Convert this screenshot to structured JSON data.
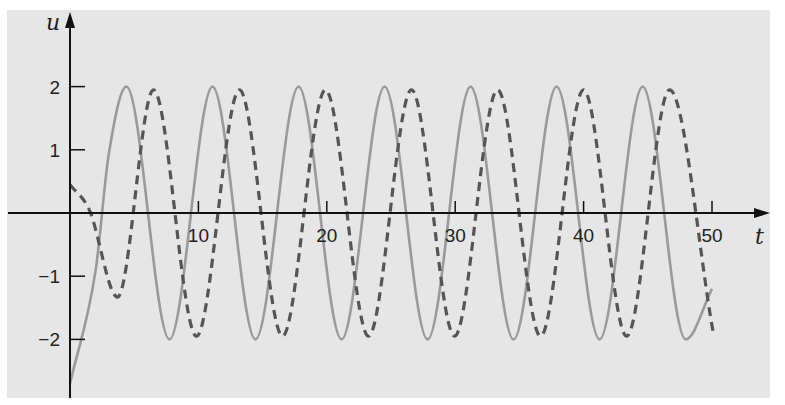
{
  "chart_data": {
    "type": "line",
    "title": "",
    "xlabel": "t",
    "ylabel": "u",
    "xlim": [
      0,
      50
    ],
    "ylim": [
      -2.8,
      3.2
    ],
    "x_ticks": [
      10,
      20,
      30,
      40,
      50
    ],
    "x_tick_labels": [
      "10",
      "20",
      "30",
      "40",
      "50"
    ],
    "y_ticks": [
      2,
      1,
      -1,
      -2
    ],
    "y_tick_labels": [
      "2",
      "1",
      "−1",
      "−2"
    ],
    "grid": false,
    "legend": null,
    "series": [
      {
        "name": "u (solid)",
        "style": "solid",
        "color": "#9a9a9a",
        "key_points": [
          {
            "t": 0.0,
            "u": -2.7
          },
          {
            "t": 2.0,
            "u": -0.9
          },
          {
            "t": 3.0,
            "u": 0.9
          },
          {
            "t": 4.4,
            "u": 2.0
          },
          {
            "t": 7.75,
            "u": -2.0
          },
          {
            "t": 11.1,
            "u": 2.0
          },
          {
            "t": 14.45,
            "u": -2.0
          },
          {
            "t": 17.8,
            "u": 2.0
          },
          {
            "t": 21.15,
            "u": -2.0
          },
          {
            "t": 24.5,
            "u": 2.0
          },
          {
            "t": 27.85,
            "u": -2.0
          },
          {
            "t": 31.2,
            "u": 2.0
          },
          {
            "t": 34.55,
            "u": -2.0
          },
          {
            "t": 37.9,
            "u": 2.0
          },
          {
            "t": 41.25,
            "u": -2.0
          },
          {
            "t": 44.6,
            "u": 2.0
          },
          {
            "t": 47.95,
            "u": -2.0
          },
          {
            "t": 50.0,
            "u": -1.2
          }
        ]
      },
      {
        "name": "u' (dashed)",
        "style": "dashed",
        "color": "#555555",
        "key_points": [
          {
            "t": 0.0,
            "u": 0.45
          },
          {
            "t": 1.5,
            "u": 0.05
          },
          {
            "t": 3.7,
            "u": -1.33
          },
          {
            "t": 6.5,
            "u": 1.95
          },
          {
            "t": 9.85,
            "u": -1.95
          },
          {
            "t": 13.2,
            "u": 1.95
          },
          {
            "t": 16.55,
            "u": -1.95
          },
          {
            "t": 19.9,
            "u": 1.95
          },
          {
            "t": 23.25,
            "u": -1.95
          },
          {
            "t": 26.6,
            "u": 1.95
          },
          {
            "t": 29.95,
            "u": -1.95
          },
          {
            "t": 33.3,
            "u": 1.95
          },
          {
            "t": 36.65,
            "u": -1.95
          },
          {
            "t": 40.0,
            "u": 1.95
          },
          {
            "t": 43.35,
            "u": -1.95
          },
          {
            "t": 46.7,
            "u": 1.95
          },
          {
            "t": 50.1,
            "u": -1.9
          }
        ]
      }
    ]
  },
  "layout": {
    "origin_px": [
      70,
      213
    ],
    "px_per_t": 12.84,
    "px_per_u": 63.2,
    "x_axis_end_px": 770,
    "y_axis_top_px": 12,
    "y_axis_bottom_px": 398
  }
}
